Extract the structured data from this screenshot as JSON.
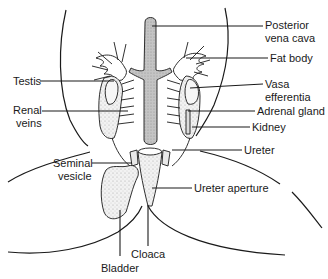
{
  "diagram": {
    "title": "",
    "colors": {
      "line": "#1a1a1a",
      "vessel_fill": "#b8b8b8",
      "organ_fill": "#efefef",
      "stipple": "#9a9a9a",
      "background": "#ffffff"
    },
    "labels": {
      "posterior_vena_cava": [
        "Posterior",
        "vena cava"
      ],
      "fat_body": [
        "Fat body"
      ],
      "testis": [
        "Testis"
      ],
      "vasa_efferentia": [
        "Vasa",
        "efferentia"
      ],
      "renal_veins": [
        "Renal",
        "veins"
      ],
      "adrenal_gland": [
        "Adrenal gland"
      ],
      "kidney": [
        "Kidney"
      ],
      "ureter": [
        "Ureter"
      ],
      "seminal_vesicle": [
        "Seminal",
        "vesicle"
      ],
      "ureter_aperture": [
        "Ureter aperture"
      ],
      "cloaca": [
        "Cloaca"
      ],
      "bladder": [
        "Bladder"
      ]
    }
  }
}
